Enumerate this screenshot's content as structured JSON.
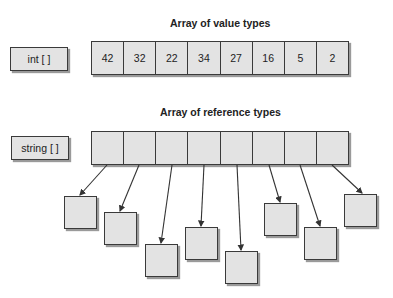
{
  "value_section": {
    "title": "Array of value types",
    "type_label": "int [ ]",
    "values": [
      "42",
      "32",
      "22",
      "34",
      "27",
      "16",
      "5",
      "2"
    ]
  },
  "reference_section": {
    "title": "Array of reference types",
    "type_label": "string [ ]",
    "cell_count": 8,
    "referenced_objects": 8
  },
  "colors": {
    "box_fill": "#e3e3e3",
    "border": "#3a3a3a",
    "text": "#222222"
  }
}
